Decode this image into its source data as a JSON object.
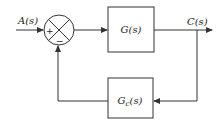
{
  "diagram": {
    "type": "feedback-control-block-diagram",
    "colors": {
      "line": "#333333",
      "background": "#ffffff"
    },
    "input": {
      "label": "A(s)"
    },
    "output": {
      "label": "C(s)"
    },
    "summing_junction": {
      "plus_sign": "+",
      "minus_sign": "−"
    },
    "forward_block": {
      "label": "G(s)"
    },
    "feedback_block": {
      "label_main": "G",
      "label_sub": "c",
      "label_tail": "(s)"
    }
  }
}
